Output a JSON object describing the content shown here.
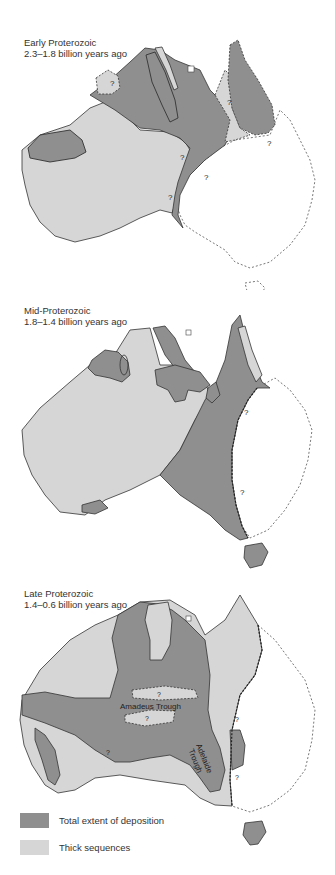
{
  "colors": {
    "deposition": "#8f8f8f",
    "thick": "#d6d6d6",
    "outline": "#333333",
    "background": "#ffffff"
  },
  "maps": [
    {
      "title": "Early Proterozoic",
      "subtitle": "2.3–1.8 billion years ago",
      "uncertain_marker": "?"
    },
    {
      "title": "Mid-Proterozoic",
      "subtitle": "1.8–1.4 billion years ago",
      "uncertain_marker": "?"
    },
    {
      "title": "Late Proterozoic",
      "subtitle": "1.4–0.6 billion years ago",
      "uncertain_marker": "?",
      "labels": {
        "amadeus": "Amadeus Trough",
        "adelaide_1": "Adelaide",
        "adelaide_2": "Trough"
      }
    }
  ],
  "legend": {
    "items": [
      {
        "label": "Total extent of deposition",
        "color": "#8f8f8f"
      },
      {
        "label": "Thick sequences",
        "color": "#d6d6d6"
      }
    ]
  }
}
